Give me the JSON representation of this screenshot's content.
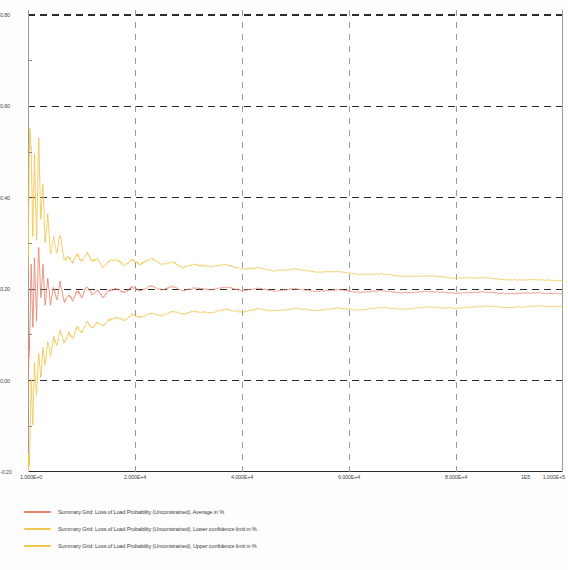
{
  "chart_data": {
    "type": "line",
    "title": "",
    "subtitle": "",
    "xlabel": "",
    "ylabel": "",
    "xlim": [
      0,
      100000
    ],
    "ylim": [
      -0.2,
      0.8
    ],
    "grid": true,
    "grid_style": "dashed",
    "legend_position": "bottom-left",
    "y_ticks": [
      "0.80",
      "0.60",
      "0.40",
      "0.20",
      "0.00",
      "-0.20"
    ],
    "y_tick_values": [
      0.8,
      0.6,
      0.4,
      0.2,
      0.0,
      -0.2
    ],
    "x_ticks": [
      "1.000E+0",
      "2.000E+4",
      "4.000E+4",
      "6.000E+4",
      "8.000E+4",
      "1E5",
      "1.000E+5"
    ],
    "x_tick_values": [
      1,
      20000,
      40000,
      60000,
      80000,
      100000,
      100000
    ],
    "series": [
      {
        "name": "Summary Grid: Loss of Load Probability (Unconstrained), Average in %",
        "short_name": "Average in %",
        "color": "#E8846E",
        "converged_value": 0.19,
        "x": [
          1,
          300,
          600,
          900,
          1200,
          1600,
          2000,
          2400,
          2800,
          3200,
          3700,
          4200,
          4800,
          5400,
          6000,
          6800,
          7600,
          8400,
          9200,
          10000,
          11000,
          12000,
          13000,
          14000,
          15000,
          16500,
          18000,
          19500,
          21000,
          23000,
          25000,
          27000,
          29000,
          31000,
          34000,
          37000,
          40000,
          43000,
          46000,
          50000,
          54000,
          58000,
          62000,
          66000,
          70000,
          75000,
          80000,
          85000,
          90000,
          95000,
          100000
        ],
        "y": [
          0.02,
          0.09,
          0.255,
          0.105,
          0.265,
          0.135,
          0.3,
          0.175,
          0.255,
          0.165,
          0.225,
          0.165,
          0.205,
          0.175,
          0.215,
          0.172,
          0.188,
          0.176,
          0.198,
          0.182,
          0.205,
          0.188,
          0.198,
          0.182,
          0.196,
          0.202,
          0.192,
          0.205,
          0.196,
          0.208,
          0.198,
          0.206,
          0.196,
          0.203,
          0.199,
          0.205,
          0.197,
          0.202,
          0.196,
          0.201,
          0.195,
          0.199,
          0.193,
          0.197,
          0.192,
          0.195,
          0.191,
          0.194,
          0.19,
          0.192,
          0.19
        ]
      },
      {
        "name": "Summary Grid: Loss of Load Probability (Unconstrained), Lower confidence limit in %",
        "short_name": "Lower confidence limit in %",
        "color": "#F0C64E",
        "converged_value": 0.165,
        "x": [
          1,
          300,
          600,
          900,
          1200,
          1600,
          2000,
          2400,
          2800,
          3200,
          3700,
          4200,
          4800,
          5400,
          6000,
          6800,
          7600,
          8400,
          9200,
          10000,
          11000,
          12000,
          13000,
          14000,
          15000,
          16500,
          18000,
          19500,
          21000,
          23000,
          25000,
          27000,
          29000,
          31000,
          34000,
          37000,
          40000,
          43000,
          46000,
          50000,
          54000,
          58000,
          62000,
          66000,
          70000,
          75000,
          80000,
          85000,
          90000,
          95000,
          100000
        ],
        "y": [
          -0.2,
          -0.17,
          0.015,
          -0.1,
          0.035,
          -0.035,
          0.065,
          0.0,
          0.075,
          0.03,
          0.085,
          0.055,
          0.095,
          0.075,
          0.108,
          0.082,
          0.105,
          0.093,
          0.118,
          0.105,
          0.128,
          0.115,
          0.128,
          0.118,
          0.132,
          0.138,
          0.132,
          0.145,
          0.138,
          0.148,
          0.142,
          0.152,
          0.145,
          0.152,
          0.148,
          0.156,
          0.15,
          0.157,
          0.152,
          0.158,
          0.153,
          0.159,
          0.154,
          0.16,
          0.156,
          0.161,
          0.158,
          0.163,
          0.16,
          0.163,
          0.162
        ]
      },
      {
        "name": "Summary Grid: Loss of Load Probability (Unconstrained), Upper confidence limit in %",
        "short_name": "Upper confidence limit in %",
        "color": "#F0C64E",
        "converged_value": 0.22,
        "x": [
          1,
          300,
          600,
          900,
          1200,
          1600,
          2000,
          2400,
          2800,
          3200,
          3700,
          4200,
          4800,
          5400,
          6000,
          6800,
          7600,
          8400,
          9200,
          10000,
          11000,
          12000,
          13000,
          14000,
          15000,
          16500,
          18000,
          19500,
          21000,
          23000,
          25000,
          27000,
          29000,
          31000,
          34000,
          37000,
          40000,
          43000,
          46000,
          50000,
          54000,
          58000,
          62000,
          66000,
          70000,
          75000,
          80000,
          85000,
          90000,
          95000,
          100000
        ],
        "y": [
          0.24,
          0.55,
          0.5,
          0.31,
          0.5,
          0.305,
          0.535,
          0.35,
          0.435,
          0.3,
          0.365,
          0.275,
          0.315,
          0.275,
          0.322,
          0.262,
          0.271,
          0.259,
          0.278,
          0.259,
          0.282,
          0.261,
          0.268,
          0.246,
          0.26,
          0.266,
          0.252,
          0.265,
          0.254,
          0.268,
          0.254,
          0.26,
          0.247,
          0.254,
          0.25,
          0.254,
          0.244,
          0.247,
          0.24,
          0.244,
          0.237,
          0.239,
          0.232,
          0.234,
          0.228,
          0.229,
          0.224,
          0.225,
          0.22,
          0.221,
          0.218
        ]
      }
    ],
    "colors": {
      "average": "#E8846E",
      "confidence": "#F0C64E",
      "grid": "#2b2b2b",
      "axis": "#555555",
      "background": "#ffffff"
    }
  },
  "legend": {
    "items": [
      {
        "label": "Summary Grid: Loss of Load Probability (Unconstrained), Average in %",
        "color": "#E8846E"
      },
      {
        "label": "Summary Grid: Loss of Load Probability (Unconstrained), Lower confidence limit in %",
        "color": "#F0C64E"
      },
      {
        "label": "Summary Grid: Loss of Load Probability (Unconstrained), Upper confidence limit in %",
        "color": "#F0C64E"
      }
    ]
  }
}
